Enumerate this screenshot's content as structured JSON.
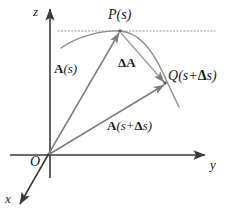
{
  "figure": {
    "colors": {
      "axis": "#3a3a3a",
      "vector": "#7d7d7d",
      "curve": "#8e8e8e",
      "dotted": "#9a9a9a",
      "text": "#1a1a1a"
    },
    "axes": [
      {
        "id": "z",
        "label": "z",
        "x": 33,
        "y": 5
      },
      {
        "id": "y",
        "label": "y",
        "x": 210,
        "y": 158
      },
      {
        "id": "x",
        "label": "x",
        "x": 5,
        "y": 192
      }
    ],
    "origin": {
      "label": "O",
      "x": 30,
      "y": 155
    },
    "points": [
      {
        "id": "P",
        "label": "P(s)",
        "base": "P",
        "arg": "(s)",
        "x": 108,
        "y": 8
      },
      {
        "id": "Q",
        "label": "Q(s+Δs)",
        "base": "Q",
        "arg": "(s+",
        "delta": "Δ",
        "arg2": "s)",
        "x": 168,
        "y": 69
      }
    ],
    "vectors": [
      {
        "id": "A_s",
        "label": "A(s)",
        "bold": "A",
        "rest": "(s)",
        "x": 54,
        "y": 62
      },
      {
        "id": "dA",
        "label": "ΔA",
        "x": 118,
        "y": 56
      },
      {
        "id": "A_s_ds",
        "label": "A(s+Δs)",
        "bold": "A",
        "open": "(s+",
        "delta": "Δ",
        "close": "s)",
        "x": 107,
        "y": 119
      }
    ],
    "geometry": {
      "origin_px": [
        48,
        155
      ],
      "P_px": [
        120,
        31
      ],
      "Q_px": [
        165,
        83
      ],
      "z_axis": [
        [
          50,
          8
        ],
        [
          50,
          178
        ]
      ],
      "y_axis": [
        [
          10,
          155
        ],
        [
          206,
          155
        ]
      ],
      "x_axis": [
        [
          48,
          155
        ],
        [
          19,
          205
        ]
      ],
      "tangent_dotted": [
        [
          58,
          31
        ],
        [
          215,
          31
        ]
      ],
      "curve_start": [
        61,
        48
      ],
      "curve_end": [
        179,
        107
      ]
    }
  }
}
